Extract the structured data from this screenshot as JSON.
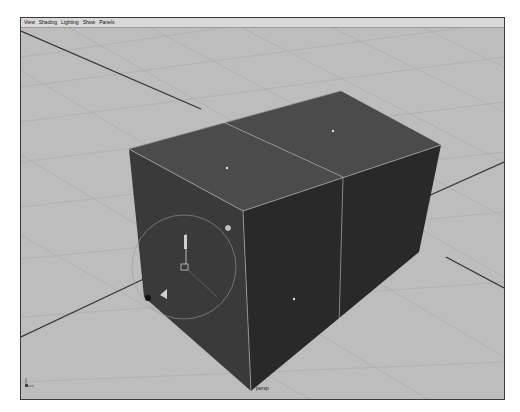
{
  "viewport": {
    "menu": [
      {
        "label": "View"
      },
      {
        "label": "Shading"
      },
      {
        "label": "Lighting"
      },
      {
        "label": "Show"
      },
      {
        "label": "Panels"
      }
    ],
    "camera_label": "persp",
    "colors": {
      "background": "#bdbdbd",
      "grid": "#a9a9a9",
      "axis_line": "#3a3a3a",
      "box_top": "#4a4a4a",
      "box_front": "#3a3a3a",
      "box_side": "#262626",
      "edge_highlight": "#cfcfcf"
    },
    "scene": {
      "object": "polygon-cube",
      "subdivisions_width": 2,
      "manipulator": "move-tool-gizmo"
    }
  }
}
